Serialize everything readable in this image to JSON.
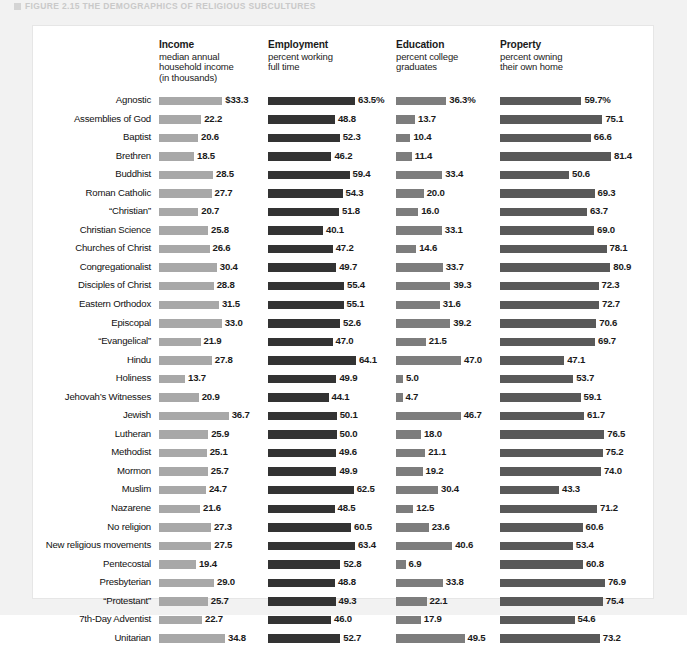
{
  "caption": {
    "figure_label": "FIGURE 2.15",
    "figure_title": "THE DEMOGRAPHICS OF RELIGIOUS SUBCULTURES",
    "full": "FIGURE 2.15  THE DEMOGRAPHICS OF RELIGIOUS SUBCULTURES"
  },
  "colors": {
    "income_bar": "#a8a8a8",
    "employment_bar": "#333333",
    "education_bar": "#7d7d7d",
    "property_bar": "#595959",
    "panel_bg": "#ffffff",
    "page_bg": "#f2f2f2"
  },
  "columns": [
    {
      "key": "income",
      "title": "Income",
      "sub1": "median annual",
      "sub2": "household income",
      "sub3": "(in thousands)"
    },
    {
      "key": "employment",
      "title": "Employment",
      "sub1": "percent working",
      "sub2": "full time",
      "sub3": ""
    },
    {
      "key": "education",
      "title": "Education",
      "sub1": "percent college",
      "sub2": "graduates",
      "sub3": ""
    },
    {
      "key": "property",
      "title": "Property",
      "sub1": "percent owning",
      "sub2": "their own home",
      "sub3": ""
    }
  ],
  "chart_data": {
    "type": "bar",
    "title": "THE DEMOGRAPHICS OF RELIGIOUS SUBCULTURES",
    "orientation": "horizontal",
    "grid": false,
    "legend": "none",
    "categories": [
      "Agnostic",
      "Assemblies of God",
      "Baptist",
      "Brethren",
      "Buddhist",
      "Roman Catholic",
      "“Christian”",
      "Christian Science",
      "Churches of Christ",
      "Congregationalist",
      "Disciples of Christ",
      "Eastern Orthodox",
      "Episcopal",
      "“Evangelical”",
      "Hindu",
      "Holiness",
      "Jehovah’s Witnesses",
      "Jewish",
      "Lutheran",
      "Methodist",
      "Mormon",
      "Muslim",
      "Nazarene",
      "No religion",
      "New religious movements",
      "Pentecostal",
      "Presbyterian",
      "“Protestant”",
      "7th-Day Adventist",
      "Unitarian"
    ],
    "series": [
      {
        "name": "Income",
        "axis_label": "median annual household income (in thousands)",
        "unit": "$ thousands",
        "max_axis": 40,
        "values": [
          33.3,
          22.2,
          20.6,
          18.5,
          28.5,
          27.7,
          20.7,
          25.8,
          26.6,
          30.4,
          28.8,
          31.5,
          33.0,
          21.9,
          27.8,
          13.7,
          20.9,
          36.7,
          25.9,
          25.1,
          25.7,
          24.7,
          21.6,
          27.3,
          27.5,
          19.4,
          29.0,
          25.7,
          22.7,
          34.8
        ],
        "labels": [
          "$33.3",
          "22.2",
          "20.6",
          "18.5",
          "28.5",
          "27.7",
          "20.7",
          "25.8",
          "26.6",
          "30.4",
          "28.8",
          "31.5",
          "33.0",
          "21.9",
          "27.8",
          "13.7",
          "20.9",
          "36.7",
          "25.9",
          "25.1",
          "25.7",
          "24.7",
          "21.6",
          "27.3",
          "27.5",
          "19.4",
          "29.0",
          "25.7",
          "22.7",
          "34.8"
        ]
      },
      {
        "name": "Employment",
        "axis_label": "percent working full time",
        "unit": "%",
        "max_axis": 70,
        "values": [
          63.5,
          48.8,
          52.3,
          46.2,
          59.4,
          54.3,
          51.8,
          40.1,
          47.2,
          49.7,
          55.4,
          55.1,
          52.6,
          47.0,
          64.1,
          49.9,
          44.1,
          50.1,
          50.0,
          49.6,
          49.9,
          62.5,
          48.5,
          60.5,
          63.4,
          52.8,
          48.8,
          49.3,
          46.0,
          52.7
        ],
        "labels": [
          "63.5%",
          "48.8",
          "52.3",
          "46.2",
          "59.4",
          "54.3",
          "51.8",
          "40.1",
          "47.2",
          "49.7",
          "55.4",
          "55.1",
          "52.6",
          "47.0",
          "64.1",
          "49.9",
          "44.1",
          "50.1",
          "50.0",
          "49.6",
          "49.9",
          "62.5",
          "48.5",
          "60.5",
          "63.4",
          "52.8",
          "48.8",
          "49.3",
          "46.0",
          "52.7"
        ]
      },
      {
        "name": "Education",
        "axis_label": "percent college graduates",
        "unit": "%",
        "max_axis": 52,
        "values": [
          36.3,
          13.7,
          10.4,
          11.4,
          33.4,
          20.0,
          16.0,
          33.1,
          14.6,
          33.7,
          39.3,
          31.6,
          39.2,
          21.5,
          47.0,
          5.0,
          4.7,
          46.7,
          18.0,
          21.1,
          19.2,
          30.4,
          12.5,
          23.6,
          40.6,
          6.9,
          33.8,
          22.1,
          17.9,
          49.5
        ],
        "labels": [
          "36.3%",
          "13.7",
          "10.4",
          "11.4",
          "33.4",
          "20.0",
          "16.0",
          "33.1",
          "14.6",
          "33.7",
          "39.3",
          "31.6",
          "39.2",
          "21.5",
          "47.0",
          "5.0",
          "4.7",
          "46.7",
          "18.0",
          "21.1",
          "19.2",
          "30.4",
          "12.5",
          "23.6",
          "40.6",
          "6.9",
          "33.8",
          "22.1",
          "17.9",
          "49.5"
        ]
      },
      {
        "name": "Property",
        "axis_label": "percent owning their own home",
        "unit": "%",
        "max_axis": 88,
        "values": [
          59.7,
          75.1,
          66.6,
          81.4,
          50.6,
          69.3,
          63.7,
          69.0,
          78.1,
          80.9,
          72.3,
          72.7,
          70.6,
          69.7,
          47.1,
          53.7,
          59.1,
          61.7,
          76.5,
          75.2,
          74.0,
          43.3,
          71.2,
          60.6,
          53.4,
          60.8,
          76.9,
          75.4,
          54.6,
          73.2
        ],
        "labels": [
          "59.7%",
          "75.1",
          "66.6",
          "81.4",
          "50.6",
          "69.3",
          "63.7",
          "69.0",
          "78.1",
          "80.9",
          "72.3",
          "72.7",
          "70.6",
          "69.7",
          "47.1",
          "53.7",
          "59.1",
          "61.7",
          "76.5",
          "75.2",
          "74.0",
          "43.3",
          "71.2",
          "60.6",
          "53.4",
          "60.8",
          "76.9",
          "75.4",
          "54.6",
          "73.2"
        ]
      }
    ]
  }
}
